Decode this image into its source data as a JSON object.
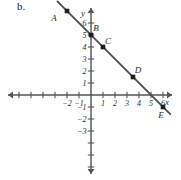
{
  "figure": {
    "part_label": "b."
  },
  "chart_data": {
    "type": "line",
    "title": "",
    "xlabel": "x",
    "ylabel": "y",
    "grid": false,
    "legend": "none",
    "xlim": [
      -7.5,
      7.5
    ],
    "ylim": [
      -7.5,
      7.5
    ],
    "x_ticks": [
      -6,
      -5,
      -4,
      -3,
      -2,
      -1,
      1,
      2,
      3,
      4,
      5,
      6
    ],
    "x_tick_labels": [
      "",
      "",
      "",
      "",
      "-2",
      "-1",
      "1",
      "2",
      "3",
      "4",
      "5",
      "6"
    ],
    "y_ticks": [
      6,
      5,
      4,
      3,
      2,
      1,
      -1,
      -2,
      -3,
      -4,
      -5,
      -6
    ],
    "y_tick_labels": [
      "6",
      "5",
      "4",
      "3",
      "2",
      "1",
      "-1",
      "-2",
      "-3",
      "",
      "",
      ""
    ],
    "series": [
      {
        "name": "line",
        "slope": -1,
        "intercept": 5,
        "x": [
          -2.8,
          6.6
        ],
        "y": [
          7.8,
          -1.6
        ]
      }
    ],
    "points": [
      {
        "name": "A",
        "x": -2,
        "y": 7,
        "label_dx": -13,
        "label_dy": 10
      },
      {
        "name": "B",
        "x": 0,
        "y": 5,
        "label_dx": 5,
        "label_dy": -4
      },
      {
        "name": "C",
        "x": 1,
        "y": 4,
        "label_dx": 5,
        "label_dy": -3
      },
      {
        "name": "D",
        "x": 3.5,
        "y": 1.5,
        "label_dx": 5,
        "label_dy": -4
      },
      {
        "name": "E",
        "x": 6,
        "y": -1,
        "label_dx": -2,
        "label_dy": 11
      }
    ],
    "axis_labels": {
      "x": "x",
      "y": "y"
    },
    "colors": {
      "line": "#4a4a4a",
      "axis": "#555555",
      "marker": "#1e1e1e",
      "text": "#2b2b2b",
      "background": "#ffffff"
    }
  }
}
